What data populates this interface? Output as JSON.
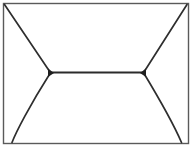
{
  "figure": {
    "title": "Envelope outline line drawing",
    "width": 193,
    "height": 148,
    "background_color": "#ffffff",
    "line_color": "#2e2e2e",
    "frame_color": "#5a5a5a",
    "line_width": 1.7
  },
  "chart_data": {
    "type": "line",
    "title": "Envelope outline line drawing",
    "xlabel": "",
    "ylabel": "",
    "xlim": [
      0,
      193
    ],
    "ylim": [
      0,
      148
    ],
    "grid": false,
    "legend": "none",
    "series": [
      {
        "name": "outer-frame",
        "kind": "rectangle",
        "x": [
          3.5,
          188.5,
          188.5,
          3.5,
          3.5
        ],
        "y": [
          3.5,
          3.5,
          143.5,
          143.5,
          3.5
        ]
      },
      {
        "name": "upper-left-flap-diagonal",
        "kind": "straight",
        "x": [
          4.5,
          50.0
        ],
        "y": [
          4.5,
          72.0
        ]
      },
      {
        "name": "upper-right-flap-diagonal",
        "kind": "straight",
        "x": [
          187.0,
          144.0
        ],
        "y": [
          4.5,
          72.0
        ]
      },
      {
        "name": "horizontal-seam",
        "kind": "straight",
        "x": [
          50.0,
          144.0
        ],
        "y": [
          72.5,
          72.5
        ]
      },
      {
        "name": "lower-left-flap-curve",
        "kind": "curve",
        "x": [
          50.0,
          30.0,
          16.0,
          12.0
        ],
        "y": [
          73.5,
          105.0,
          132.0,
          142.5
        ]
      },
      {
        "name": "lower-right-flap-curve",
        "kind": "curve",
        "x": [
          144.0,
          163.0,
          177.0,
          181.5
        ],
        "y": [
          73.5,
          105.0,
          132.0,
          142.5
        ]
      }
    ],
    "vertices": [
      {
        "name": "top-left-corner",
        "x": 4,
        "y": 4
      },
      {
        "name": "top-right-corner",
        "x": 188,
        "y": 4
      },
      {
        "name": "left-seam-junction",
        "x": 50,
        "y": 72
      },
      {
        "name": "right-seam-junction",
        "x": 144,
        "y": 72
      },
      {
        "name": "bottom-left-flap-foot",
        "x": 12,
        "y": 143
      },
      {
        "name": "bottom-right-flap-foot",
        "x": 182,
        "y": 143
      }
    ]
  }
}
